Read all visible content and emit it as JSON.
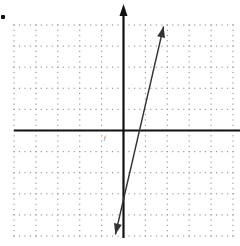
{
  "chart_data": {
    "type": "line",
    "title": "",
    "xlabel": "",
    "ylabel": "",
    "xlim": [
      -5,
      5
    ],
    "ylim": [
      -5,
      5
    ],
    "grid": true,
    "grid_style": "dotted",
    "grid_major_step": 1,
    "grid_minor_dots_per_unit": 4,
    "axes_arrows": [
      "y-top",
      "y-bottom-none"
    ],
    "series": [
      {
        "name": "line",
        "equation": "y = 4x - 3",
        "x": [
          -0.37,
          0.78,
          1.83
        ],
        "y": [
          -4.93,
          0,
          4.93
        ],
        "arrows_both_ends": true,
        "color": "#333333"
      }
    ],
    "annotations": [
      {
        "text": "f",
        "x": -0.9,
        "y": -0.45
      }
    ]
  },
  "page": {
    "bullet": "•"
  },
  "colors": {
    "axis": "#111111",
    "grid_dot": "#9a9a9a",
    "line": "#333333"
  }
}
